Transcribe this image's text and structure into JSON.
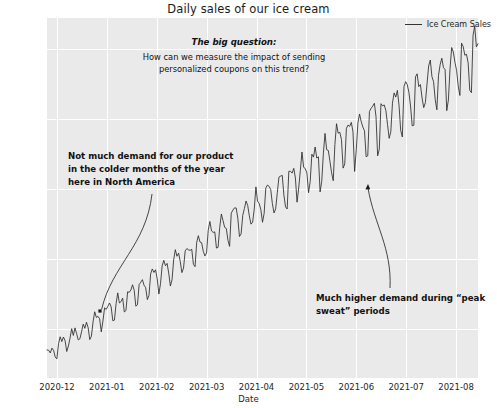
{
  "chart_data": {
    "type": "line",
    "title": "Daily sales of our ice cream",
    "xlabel": "Date",
    "ylabel": "Sales",
    "grid": true,
    "legend_position": "top-right",
    "legend_entries": [
      "Ice Cream Sales"
    ],
    "xtick_labels": [
      "2020-12",
      "2021-01",
      "2021-02",
      "2021-03",
      "2021-04",
      "2021-05",
      "2021-06",
      "2021-07",
      "2021-08"
    ],
    "ytick_labels": [
      "100000",
      "200000",
      "300000",
      "400000",
      "500000"
    ],
    "ytick_values": [
      100000,
      200000,
      300000,
      400000,
      500000
    ],
    "ylim": [
      30000,
      545000
    ],
    "xlim": [
      "2020-12-01",
      "2021-08-20"
    ],
    "series": [
      {
        "name": "Ice Cream Sales",
        "color": "#2b2b2b",
        "x_start": "2020-12-01",
        "x_end": "2021-08-20",
        "n_points": 263,
        "description": "Daily ice cream sales rising from roughly 55,000 in December 2020 to roughly 520,000 in August 2021, with strong weekly oscillation of growing amplitude.",
        "trend_start": 62000,
        "trend_end": 500000,
        "weekly_amplitude_start": 9000,
        "weekly_amplitude_end": 38000,
        "noise_amplitude": 11000,
        "values": [
          58000,
          72000,
          61000,
          78000,
          66000,
          83000,
          70000,
          88000,
          74000,
          93000,
          80000,
          97000,
          85000,
          101000,
          90000,
          107000,
          95000,
          112000,
          101000,
          118000,
          107000,
          123000,
          112000,
          129000,
          118000,
          135000,
          124000,
          141000,
          130000,
          147000,
          136000,
          153000,
          142000,
          159000,
          148000,
          165000,
          154000,
          171000,
          160000,
          177000,
          166000,
          183000,
          172000,
          189000,
          178000,
          195000,
          184000,
          201000,
          190000,
          207000,
          196000,
          213000,
          202000,
          219000,
          208000,
          226000,
          215000,
          232000,
          221000,
          238000,
          227000,
          245000,
          234000,
          251000,
          240000,
          258000,
          247000,
          264000,
          253000,
          271000,
          260000,
          277000,
          266000,
          284000,
          273000,
          291000,
          280000,
          297000,
          286000,
          304000,
          293000,
          311000,
          300000,
          317000,
          306000,
          324000,
          313000,
          331000,
          320000,
          338000,
          327000,
          345000,
          334000,
          352000,
          341000,
          359000,
          348000,
          366000,
          355000,
          373000,
          362000,
          381000,
          370000,
          388000,
          377000,
          396000,
          385000,
          403000,
          392000,
          411000,
          400000,
          419000,
          408000,
          427000,
          416000,
          435000,
          424000,
          443000,
          432000,
          451000,
          440000,
          459000,
          448000,
          468000,
          457000,
          476000,
          465000,
          485000,
          474000,
          494000,
          483000,
          503000,
          492000,
          512000,
          501000,
          520000
        ]
      }
    ],
    "annotations": [
      {
        "id": "big-question",
        "head": "The big question:",
        "body": "How can we measure the impact of sending personalized coupons on this trend?",
        "style": "bold-italic-head"
      },
      {
        "id": "cold-months",
        "text": "Not much demand for our product in the colder months of the year here in North America",
        "style": "bold",
        "arrow": {
          "from_x": 152,
          "from_y": 194,
          "to_x": 100,
          "to_y": 311,
          "curved": true
        }
      },
      {
        "id": "peak-sweat",
        "text": "Much higher demand during “peak sweat” periods",
        "style": "bold",
        "arrow": {
          "from_x": 390,
          "from_y": 288,
          "to_x": 368,
          "to_y": 184,
          "curved": true
        }
      }
    ]
  },
  "colors": {
    "line": "#2b2b2b",
    "plot_background": "#eaeaea",
    "grid": "#ffffff",
    "text": "#1a1a1a",
    "page_background": "#ffffff"
  }
}
